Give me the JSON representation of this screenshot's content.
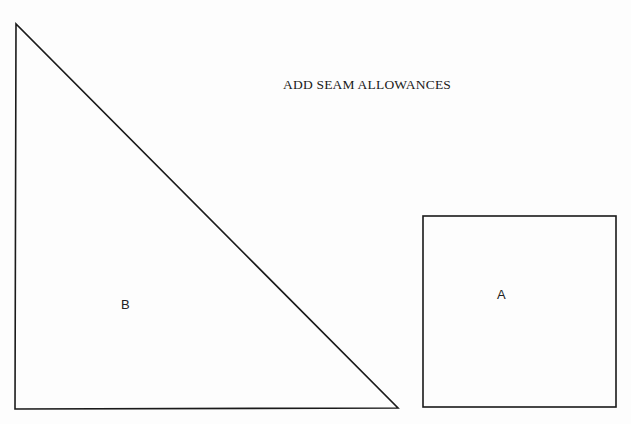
{
  "title": "ADD SEAM ALLOWANCES",
  "pieces": [
    {
      "id": "B",
      "label": "B",
      "shape": "right-triangle",
      "vertices": [
        [
          16,
          24
        ],
        [
          15,
          409
        ],
        [
          398,
          408
        ]
      ]
    },
    {
      "id": "A",
      "label": "A",
      "shape": "square",
      "x": 423,
      "y": 216,
      "width": 193,
      "height": 191
    }
  ],
  "colors": {
    "line": "#1a1a1a",
    "background": "#fdfdfd"
  }
}
